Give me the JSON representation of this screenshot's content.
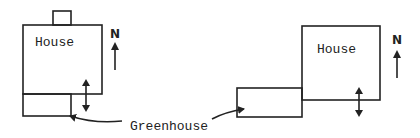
{
  "diagram": {
    "type": "site-plan-comparison",
    "stroke_color": "#222222",
    "background": "#ffffff",
    "left_plan": {
      "house_label": "House",
      "north_label": "N",
      "elements": [
        "chimney",
        "house",
        "greenhouse-attached-south",
        "north-arrow",
        "double-arrow"
      ]
    },
    "right_plan": {
      "house_label": "House",
      "north_label": "N",
      "elements": [
        "house",
        "greenhouse-attached-southwest",
        "north-arrow",
        "double-arrow"
      ]
    },
    "shared_label": "Greenhouse"
  }
}
